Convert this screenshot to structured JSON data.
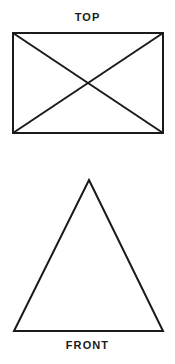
{
  "page": {
    "background_color": "#ffffff",
    "width": 175,
    "height": 364
  },
  "style": {
    "line_color": "#1a1a1a",
    "line_width": 2,
    "label_color": "#1a1a1a",
    "label_font_size": 11,
    "label_letter_spacing": 1.1
  },
  "views": {
    "top": {
      "label": "TOP",
      "label_center_x": 88,
      "label_y": 17,
      "shape": "rectangle-with-diagonals",
      "rectangle": {
        "left": 13,
        "top": 33,
        "right": 163,
        "bottom": 133,
        "width": 150,
        "height": 100
      },
      "diagonals": [
        {
          "x1": 13,
          "y1": 33,
          "x2": 163,
          "y2": 133
        },
        {
          "x1": 163,
          "y1": 33,
          "x2": 13,
          "y2": 133
        }
      ],
      "diagonal_intersection": {
        "x": 88,
        "y": 83
      }
    },
    "front": {
      "label": "FRONT",
      "label_center_x": 88,
      "label_y": 345,
      "shape": "triangle",
      "triangle": {
        "apex": {
          "x": 89,
          "y": 180
        },
        "base_left": {
          "x": 14,
          "y": 331
        },
        "base_right": {
          "x": 163,
          "y": 331
        },
        "base_width": 149,
        "height": 151
      }
    }
  }
}
